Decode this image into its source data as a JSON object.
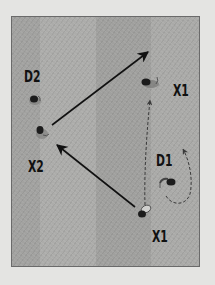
{
  "diagram": {
    "type": "basketball-play",
    "colors": {
      "page_bg": "#e4e4e2",
      "court_stripe_dark": "#9f9f9d",
      "court_stripe_light": "#ababa9",
      "court_border": "#6a6a6a",
      "arrow": "#111111",
      "dashed_arrow": "#3a3a3a",
      "label": "#111111"
    },
    "labels": [
      {
        "id": "D2",
        "text": "D2",
        "x": 24,
        "y": 70
      },
      {
        "id": "X1_top",
        "text": "X1",
        "x": 173,
        "y": 84
      },
      {
        "id": "D1",
        "text": "D1",
        "x": 156,
        "y": 154
      },
      {
        "id": "X2",
        "text": "X2",
        "x": 28,
        "y": 160
      },
      {
        "id": "X1_bottom",
        "text": "X1",
        "x": 152,
        "y": 230
      }
    ],
    "players": [
      {
        "id": "D2",
        "x": 35,
        "y": 100
      },
      {
        "id": "X2",
        "x": 41,
        "y": 131
      },
      {
        "id": "X1_top",
        "x": 148,
        "y": 82
      },
      {
        "id": "D1",
        "x": 168,
        "y": 182
      },
      {
        "id": "X1_bottom",
        "x": 143,
        "y": 212
      }
    ],
    "arrows": [
      {
        "id": "pass_X2_to_top",
        "style": "solid",
        "from": [
          52,
          125
        ],
        "to": [
          148,
          52
        ]
      },
      {
        "id": "pass_X1_to_X2",
        "style": "solid",
        "from": [
          135,
          207
        ],
        "to": [
          57,
          145
        ]
      },
      {
        "id": "cut_X1_up",
        "style": "dashed",
        "from": [
          145,
          205
        ],
        "to": [
          150,
          100
        ]
      },
      {
        "id": "D1_recover",
        "style": "dashed-curve"
      }
    ]
  }
}
